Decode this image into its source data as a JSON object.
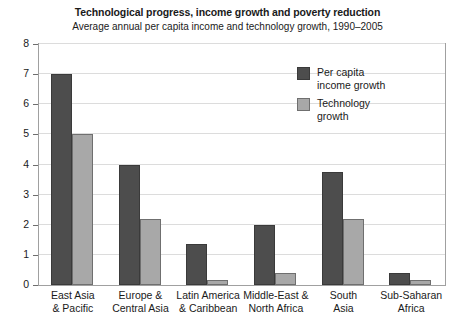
{
  "chart_data": {
    "type": "bar",
    "title": "Technological progress, income growth and poverty reduction",
    "subtitle": "Average annual per capita income and technology growth, 1990–2005",
    "xlabel": "",
    "ylabel": "",
    "ylim": [
      0,
      8
    ],
    "yticks": [
      0,
      1,
      2,
      3,
      4,
      5,
      6,
      7,
      8
    ],
    "grid": true,
    "legend_position": "inside-top-right",
    "categories": [
      "East Asia\n& Pacific",
      "Europe &\nCentral Asia",
      "Latin America\n& Caribbean",
      "Middle-East &\nNorth Africa",
      "South\nAsia",
      "Sub-Saharan\nAfrica"
    ],
    "series": [
      {
        "name": "Per capita\nincome growth",
        "color": "#4d4d4d",
        "values": [
          7.0,
          4.0,
          1.35,
          2.0,
          3.75,
          0.4
        ]
      },
      {
        "name": "Technology\ngrowth",
        "color": "#a8a8a8",
        "values": [
          5.0,
          2.2,
          0.15,
          0.4,
          2.2,
          0.15
        ]
      }
    ]
  }
}
